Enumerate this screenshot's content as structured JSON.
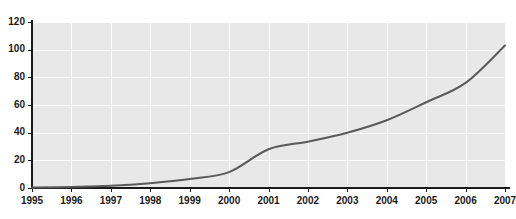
{
  "chart_data": {
    "type": "line",
    "title": "",
    "subtitle": "",
    "xlabel": "",
    "ylabel": "",
    "xlim": [
      1995,
      2007
    ],
    "ylim": [
      0,
      120
    ],
    "grid": true,
    "legend": false,
    "legend_position": "none",
    "x_tick_labels": [
      "1995",
      "1996",
      "1997",
      "1998",
      "1999",
      "2000",
      "2001",
      "2002",
      "2003",
      "2004",
      "2005",
      "2006",
      "2007"
    ],
    "y_tick_labels": [
      "0",
      "20",
      "40",
      "60",
      "80",
      "100",
      "120"
    ],
    "y_ticks": [
      0,
      20,
      40,
      60,
      80,
      100,
      120
    ],
    "x": [
      1995,
      1996,
      1997,
      1998,
      1999,
      2000,
      2001,
      2002,
      2003,
      2004,
      2005,
      2006,
      2007
    ],
    "series": [
      {
        "name": "series-1",
        "color": "#59595b",
        "values": [
          0.3,
          0.8,
          1.6,
          3.5,
          6.5,
          11.5,
          28,
          33.5,
          40,
          49,
          62,
          76,
          103
        ]
      }
    ],
    "colors": {
      "plot_background": "#e8e8e8",
      "page_background": "#ffffff",
      "gridline": "#ffffff",
      "axis": "#1a1a1a",
      "line": "#59595b",
      "tick_text": "#1a1a1a"
    }
  },
  "axes": {
    "y_axis_name": "value-axis",
    "x_axis_name": "year-axis"
  }
}
